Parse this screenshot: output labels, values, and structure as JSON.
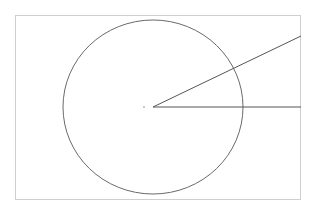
{
  "diagram": {
    "frame": {
      "x": 15.5,
      "y": 15.5,
      "width": 285,
      "height": 184,
      "stroke": "#cfcfcf"
    },
    "circle": {
      "cx": 153,
      "cy": 107,
      "rx": 90,
      "ry": 87,
      "stroke": "#6a6a6a"
    },
    "center_dot": {
      "cx": 144,
      "cy": 107,
      "r": 0.9,
      "fill": "#b0b0b0"
    },
    "lines": [
      {
        "x1": 153,
        "y1": 107,
        "x2": 301,
        "y2": 36,
        "stroke": "#555555"
      },
      {
        "x1": 153,
        "y1": 107,
        "x2": 301,
        "y2": 107,
        "stroke": "#555555"
      }
    ]
  }
}
